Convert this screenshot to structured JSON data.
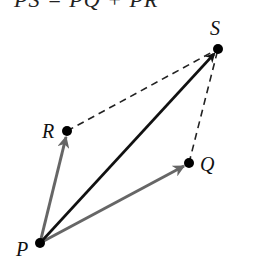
{
  "caption": "PS = PQ + PR",
  "points": {
    "P": {
      "label": "P",
      "x": 40,
      "y": 243
    },
    "Q": {
      "label": "Q",
      "x": 189,
      "y": 163
    },
    "R": {
      "label": "R",
      "x": 67,
      "y": 131
    },
    "S": {
      "label": "S",
      "x": 218,
      "y": 49
    }
  },
  "colors": {
    "resultant": "#111111",
    "component": "#666666",
    "dashed": "#222222",
    "point": "#000000"
  },
  "vectors": [
    {
      "from": "P",
      "to": "S",
      "style": "solid-black"
    },
    {
      "from": "P",
      "to": "Q",
      "style": "solid-gray"
    },
    {
      "from": "P",
      "to": "R",
      "style": "solid-gray"
    }
  ],
  "dashed_edges": [
    {
      "from": "R",
      "to": "S"
    },
    {
      "from": "Q",
      "to": "S"
    }
  ]
}
